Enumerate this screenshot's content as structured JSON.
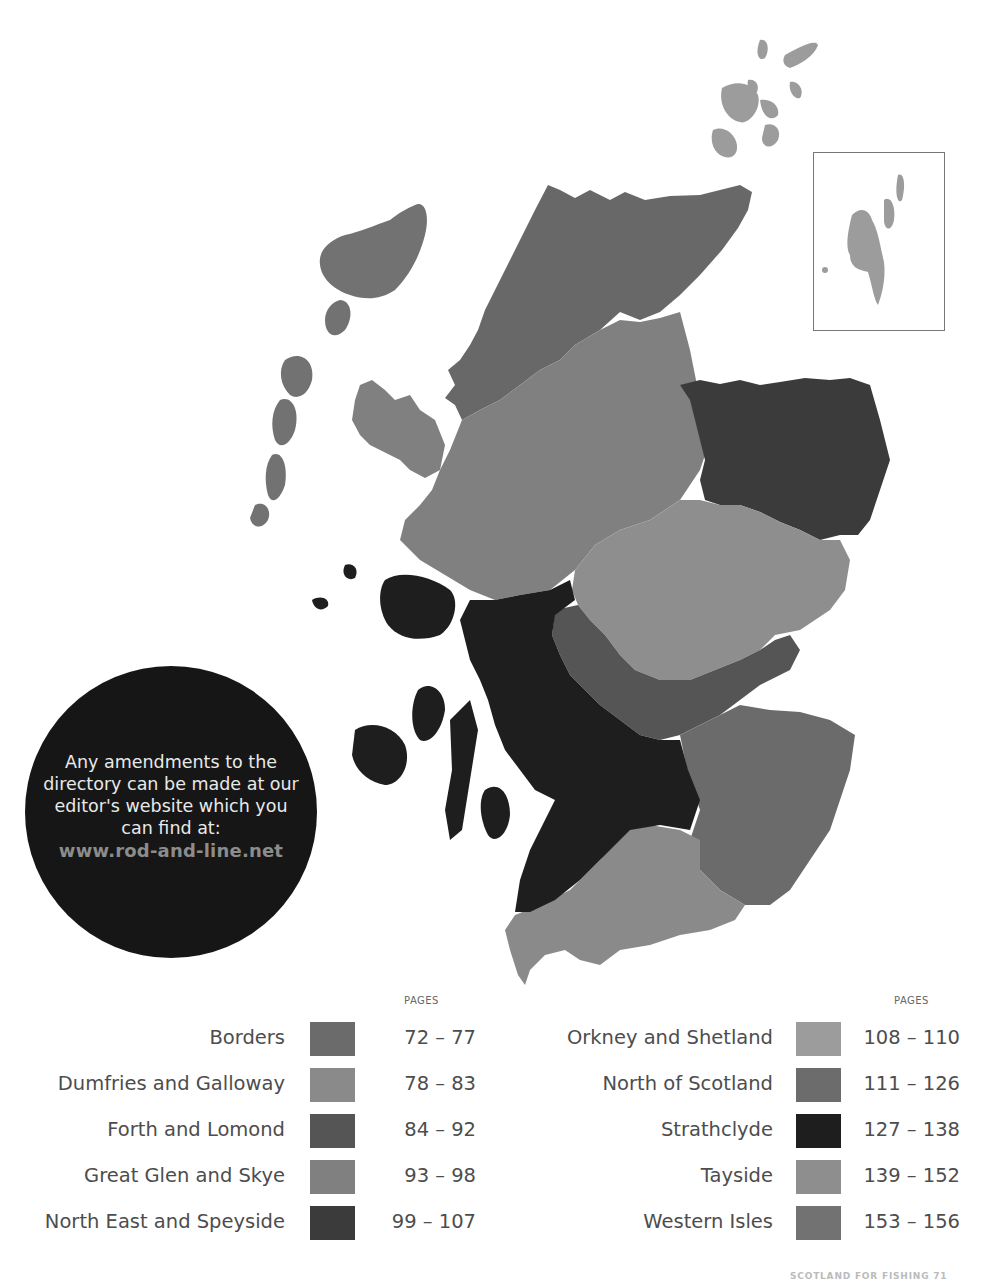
{
  "map": {
    "title": "Scotland fishing regions map",
    "inset_label": "Shetland inset",
    "regions": [
      {
        "name": "Borders",
        "color": "#6a6a6a"
      },
      {
        "name": "Dumfries and Galloway",
        "color": "#8a8a8a"
      },
      {
        "name": "Forth and Lomond",
        "color": "#555555"
      },
      {
        "name": "Great Glen and Skye",
        "color": "#7f7f7f"
      },
      {
        "name": "North East and Speyside",
        "color": "#3a3a3a"
      },
      {
        "name": "Orkney and Shetland",
        "color": "#9a9a9a"
      },
      {
        "name": "North of Scotland",
        "color": "#686868"
      },
      {
        "name": "Strathclyde",
        "color": "#1c1c1c"
      },
      {
        "name": "Tayside",
        "color": "#8f8f8f"
      },
      {
        "name": "Western Isles",
        "color": "#707070"
      }
    ]
  },
  "info_circle": {
    "message": "Any amendments to the directory can be made at our editor's website which you can find at:",
    "url": "www.rod-and-line.net"
  },
  "legend": {
    "pages_header": "PAGES",
    "left": [
      {
        "name": "Borders",
        "range": "72 – 77",
        "color": "#6b6b6b"
      },
      {
        "name": "Dumfries and Galloway",
        "range": "78 – 83",
        "color": "#8a8a8a"
      },
      {
        "name": "Forth and Lomond",
        "range": "84 – 92",
        "color": "#555555"
      },
      {
        "name": "Great Glen and Skye",
        "range": "93 – 98",
        "color": "#808080"
      },
      {
        "name": "North East and Speyside",
        "range": "99 – 107",
        "color": "#3b3b3b"
      }
    ],
    "right": [
      {
        "name": "Orkney and Shetland",
        "range": "108 – 110",
        "color": "#9c9c9c"
      },
      {
        "name": "North of Scotland",
        "range": "111 – 126",
        "color": "#6c6c6c"
      },
      {
        "name": "Strathclyde",
        "range": "127 – 138",
        "color": "#1e1e1e"
      },
      {
        "name": "Tayside",
        "range": "139 – 152",
        "color": "#8e8e8e"
      },
      {
        "name": "Western Isles",
        "range": "153 – 156",
        "color": "#727272"
      }
    ]
  },
  "footer": {
    "text": "SCOTLAND FOR FISHING 71"
  }
}
